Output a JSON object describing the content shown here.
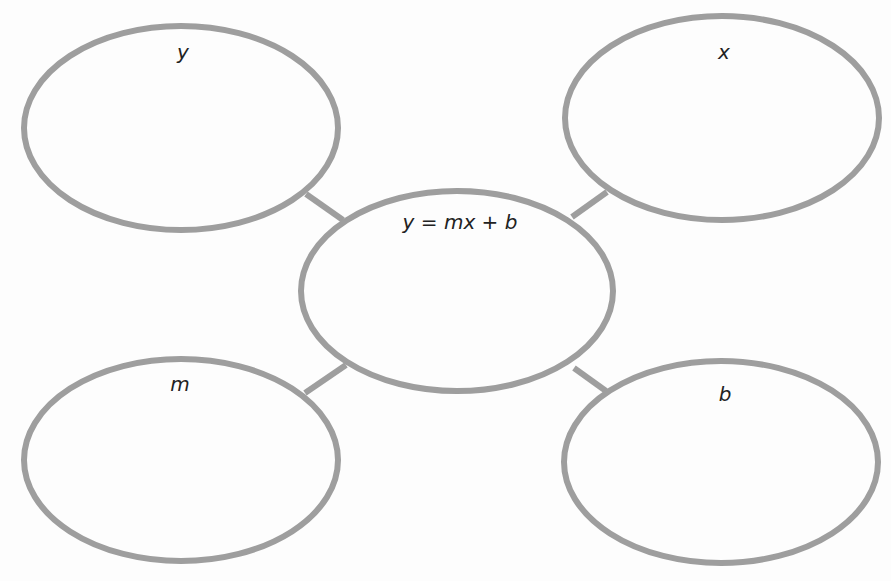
{
  "diagram": {
    "type": "concept-map",
    "colors": {
      "stroke": "#9e9e9e",
      "text": "#222222",
      "background": "#fdfdfd"
    },
    "center": {
      "label": "y = mx + b"
    },
    "nodes": [
      {
        "id": "top-left",
        "label": "y"
      },
      {
        "id": "top-right",
        "label": "x"
      },
      {
        "id": "bottom-left",
        "label": "m"
      },
      {
        "id": "bottom-right",
        "label": "b"
      }
    ]
  }
}
